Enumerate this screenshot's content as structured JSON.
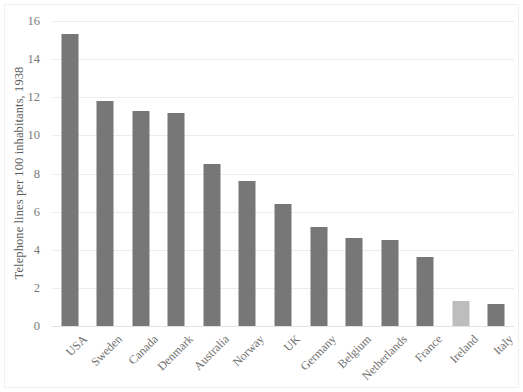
{
  "chart_data": {
    "type": "bar",
    "title": "",
    "subtitle": "",
    "xlabel": "",
    "ylabel": "Telephone lines per 100 inhabitants, 1938",
    "categories": [
      "USA",
      "Sweden",
      "Canada",
      "Denmark",
      "Australia",
      "Norway",
      "UK",
      "Germany",
      "Belgium",
      "Netherlands",
      "France",
      "Ireland",
      "Italy"
    ],
    "values": [
      15.3,
      11.8,
      11.3,
      11.2,
      8.5,
      7.6,
      6.4,
      5.2,
      4.6,
      4.5,
      3.6,
      1.3,
      1.15
    ],
    "ylim": [
      0,
      16
    ],
    "ytick_values": [
      0,
      2,
      4,
      6,
      8,
      10,
      12,
      14,
      16
    ],
    "ytick_labels": [
      "0",
      "2",
      "4",
      "6",
      "8",
      "10",
      "12",
      "14",
      "16"
    ],
    "grid": true,
    "legend": false,
    "legend_position": "none",
    "bar_color": "#777777",
    "highlight_color": "#bdbdbd",
    "highlight_categories": [
      "Ireland"
    ],
    "gridline_color": "#ededed",
    "background_color": "#ffffff",
    "xtick_label_rotation": -45,
    "series": [
      {
        "name": "Telephone lines per 100 inhabitants, 1938",
        "values": [
          15.3,
          11.8,
          11.3,
          11.2,
          8.5,
          7.6,
          6.4,
          5.2,
          4.6,
          4.5,
          3.6,
          1.3,
          1.15
        ]
      }
    ]
  }
}
